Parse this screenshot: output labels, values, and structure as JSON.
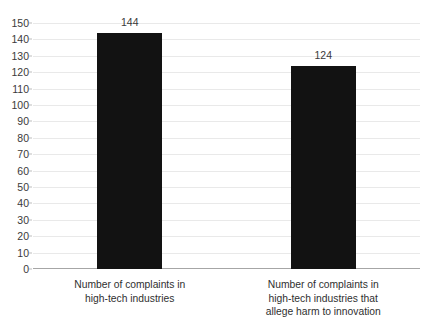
{
  "chart_data": {
    "type": "bar",
    "title": "",
    "xlabel": "",
    "ylabel": "",
    "categories": [
      "Number of complaints in\nhigh-tech industries",
      "Number of complaints in\nhigh-tech industries that\nallege harm to innovation"
    ],
    "category_lines": [
      [
        "Number of complaints in",
        "high-tech industries"
      ],
      [
        "Number of complaints in",
        "high-tech industries that",
        "allege harm to innovation"
      ]
    ],
    "values": [
      144,
      124
    ],
    "value_labels": [
      "144",
      "124"
    ],
    "ylim": [
      0,
      150
    ],
    "ytick_step": 10,
    "yticks": [
      0,
      10,
      20,
      30,
      40,
      50,
      60,
      70,
      80,
      90,
      100,
      110,
      120,
      130,
      140,
      150
    ],
    "ytick_labels": [
      "0",
      "10",
      "20",
      "30",
      "40",
      "50",
      "60",
      "70",
      "80",
      "90",
      "100",
      "110",
      "120",
      "130",
      "140",
      "150"
    ],
    "grid": true,
    "legend": false,
    "legend_position": "none",
    "bar_color": "#121212",
    "gridline_color": "#e9e9e9",
    "axis_color": "#a6a6a6",
    "background_color": "#ffffff",
    "tick_label_color": "#3a3a3a"
  }
}
